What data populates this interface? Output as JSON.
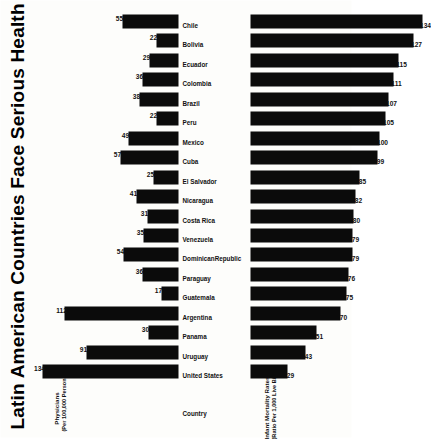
{
  "title": "Latin American Countries Face Serious Health Problems",
  "category_header": "Country",
  "top_axis": {
    "line1": "Physicians",
    "line2": "(Per 100,000 Persons)"
  },
  "bottom_axis": {
    "line1": "Infant Mortality Rates",
    "line2": "(Ratio Per 1,000 Live Births)"
  },
  "colors": {
    "bar": "#0b0b0b",
    "text": "#111111",
    "background": "#fdfdfb"
  },
  "chart_data": {
    "type": "bar",
    "title": "Latin American Countries Face Serious Health Problems",
    "xlabel": "Country",
    "categories": [
      "United States",
      "Uruguay",
      "Panama",
      "Argentina",
      "Guatemala",
      "Paraguay",
      "DominicanRepublic",
      "Venezuela",
      "Costa Rica",
      "Nicaragua",
      "El Salvador",
      "Cuba",
      "Mexico",
      "Peru",
      "Brazil",
      "Colombia",
      "Ecuador",
      "Bolivia",
      "Chile"
    ],
    "series": [
      {
        "name": "Physicians",
        "ylabel": "Physicians (Per 100,000 Persons)",
        "ylim": [
          0,
          140
        ],
        "direction": "up",
        "values": [
          134,
          91,
          30,
          112,
          17,
          36,
          54,
          35,
          31,
          41,
          25,
          57,
          49,
          22,
          38,
          36,
          29,
          22,
          55
        ]
      },
      {
        "name": "Infant Mortality Rates",
        "ylabel": "Infant Mortality Rates (Ratio Per 1,000 Live Births)",
        "ylim": [
          0,
          140
        ],
        "direction": "down",
        "values": [
          29,
          43,
          51,
          70,
          75,
          76,
          79,
          79,
          80,
          82,
          85,
          99,
          100,
          105,
          107,
          111,
          115,
          127,
          134
        ]
      }
    ],
    "grid": false,
    "legend": "none",
    "orientation": "rotated-90-ccw"
  }
}
